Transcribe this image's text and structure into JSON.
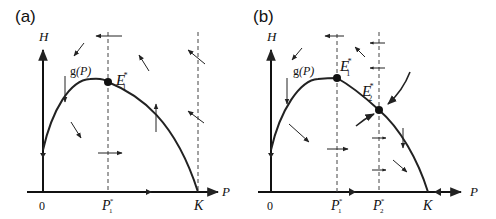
{
  "figure": {
    "panels": [
      {
        "id": "a",
        "label": "(a)",
        "y_axis_label": "H",
        "x_axis_label": "P",
        "curve_label_func": "g",
        "curve_label_arg": "(P)",
        "origin_label": "0",
        "equilibria": [
          {
            "name": "E",
            "sub": "1",
            "sup": "*"
          }
        ],
        "x_ticks": [
          {
            "name": "P",
            "sub": "1",
            "sup": "*"
          },
          {
            "name": "K",
            "sub": "",
            "sup": ""
          }
        ]
      },
      {
        "id": "b",
        "label": "(b)",
        "y_axis_label": "H",
        "x_axis_label": "P",
        "curve_label_func": "g",
        "curve_label_arg": "(P)",
        "origin_label": "0",
        "equilibria": [
          {
            "name": "E",
            "sub": "1",
            "sup": "*"
          },
          {
            "name": "E",
            "sub": "2",
            "sup": "*"
          }
        ],
        "x_ticks": [
          {
            "name": "P",
            "sub": "1",
            "sup": "*"
          },
          {
            "name": "P",
            "sub": "2",
            "sup": "*"
          },
          {
            "name": "K",
            "sub": "",
            "sup": ""
          }
        ]
      }
    ]
  }
}
